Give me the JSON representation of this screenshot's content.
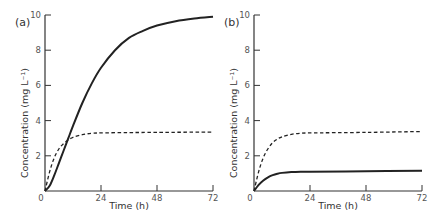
{
  "chart_data": [
    {
      "type": "line",
      "panel_label": "(a)",
      "xlabel": "Time (h)",
      "ylabel": "Concentration (mg L⁻¹)",
      "xlim": [
        0,
        72
      ],
      "ylim": [
        0,
        10
      ],
      "x_ticks": [
        "0",
        "24",
        "48",
        "72"
      ],
      "y_ticks": [
        "2",
        "4",
        "6",
        "8",
        "10"
      ],
      "grid": false,
      "series": [
        {
          "name": "solid",
          "style": "solid",
          "x": [
            0,
            2,
            4,
            6,
            8,
            10,
            12,
            16,
            20,
            24,
            30,
            36,
            42,
            48,
            56,
            64,
            72
          ],
          "y": [
            0,
            0.3,
            0.9,
            1.6,
            2.3,
            3.0,
            3.7,
            5.0,
            6.1,
            7.0,
            8.0,
            8.7,
            9.1,
            9.4,
            9.65,
            9.8,
            9.9
          ]
        },
        {
          "name": "dashed",
          "style": "dashed",
          "x": [
            0,
            2,
            4,
            6,
            8,
            10,
            12,
            16,
            20,
            24,
            36,
            48,
            72
          ],
          "y": [
            0,
            1.1,
            1.9,
            2.4,
            2.7,
            2.9,
            3.05,
            3.2,
            3.28,
            3.3,
            3.32,
            3.33,
            3.35
          ]
        }
      ]
    },
    {
      "type": "line",
      "panel_label": "(b)",
      "xlabel": "Time (h)",
      "ylabel": "Concentration (mg L⁻¹)",
      "xlim": [
        0,
        72
      ],
      "ylim": [
        0,
        10
      ],
      "x_ticks": [
        "0",
        "24",
        "48",
        "72"
      ],
      "y_ticks": [
        "2",
        "4",
        "6",
        "8",
        "10"
      ],
      "grid": false,
      "series": [
        {
          "name": "solid",
          "style": "solid",
          "x": [
            0,
            2,
            4,
            6,
            8,
            10,
            12,
            16,
            20,
            24,
            48,
            72
          ],
          "y": [
            0,
            0.35,
            0.6,
            0.78,
            0.9,
            0.98,
            1.03,
            1.08,
            1.1,
            1.1,
            1.12,
            1.15
          ]
        },
        {
          "name": "dashed",
          "style": "dashed",
          "x": [
            0,
            2,
            4,
            6,
            8,
            10,
            12,
            16,
            20,
            24,
            48,
            72
          ],
          "y": [
            0,
            1.1,
            1.9,
            2.4,
            2.75,
            2.95,
            3.08,
            3.22,
            3.28,
            3.3,
            3.33,
            3.38
          ]
        }
      ]
    }
  ]
}
